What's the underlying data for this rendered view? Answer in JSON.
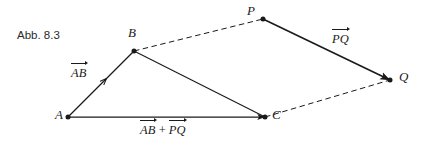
{
  "figure": {
    "caption": "Abb. 8.3",
    "width": 421,
    "height": 146,
    "background": "#ffffff",
    "stroke_color": "#1a1a1a",
    "text_color": "#1a1a1a"
  },
  "points": [
    {
      "id": "A",
      "label": "A",
      "x": 68,
      "y": 117,
      "label_x": 55,
      "label_y": 110
    },
    {
      "id": "B",
      "label": "B",
      "x": 134,
      "y": 51,
      "label_x": 128,
      "label_y": 28
    },
    {
      "id": "C",
      "label": "C",
      "x": 265,
      "y": 117,
      "label_x": 272,
      "label_y": 110
    },
    {
      "id": "P",
      "label": "P",
      "x": 263,
      "y": 19,
      "label_x": 246,
      "label_y": 5
    },
    {
      "id": "Q",
      "label": "Q",
      "x": 390,
      "y": 80,
      "label_x": 398,
      "label_y": 70
    }
  ],
  "segments": [
    {
      "id": "AB",
      "from": "A",
      "to": "B",
      "style": "solid",
      "arrow_mid": true,
      "arrow_end": false
    },
    {
      "id": "BC",
      "from": "B",
      "to": "C",
      "style": "solid",
      "arrow_mid": true,
      "arrow_end": false
    },
    {
      "id": "AC",
      "from": "A",
      "to": "C",
      "style": "solid",
      "arrow_mid": true,
      "arrow_end": true
    },
    {
      "id": "PQ",
      "from": "P",
      "to": "Q",
      "style": "solid",
      "arrow_mid": true,
      "arrow_end": true
    },
    {
      "id": "BP",
      "from": "B",
      "to": "P",
      "style": "dashed",
      "arrow_mid": false,
      "arrow_end": false
    },
    {
      "id": "CQ",
      "from": "C",
      "to": "Q",
      "style": "dashed",
      "arrow_mid": false,
      "arrow_end": false
    }
  ],
  "vector_labels": {
    "ab": {
      "text": "AB",
      "x": 70,
      "y": 68
    },
    "pq": {
      "text": "PQ",
      "x": 330,
      "y": 34
    },
    "sum": {
      "first": "AB",
      "operator": "+",
      "second": "PQ",
      "x": 140,
      "y": 125
    }
  }
}
